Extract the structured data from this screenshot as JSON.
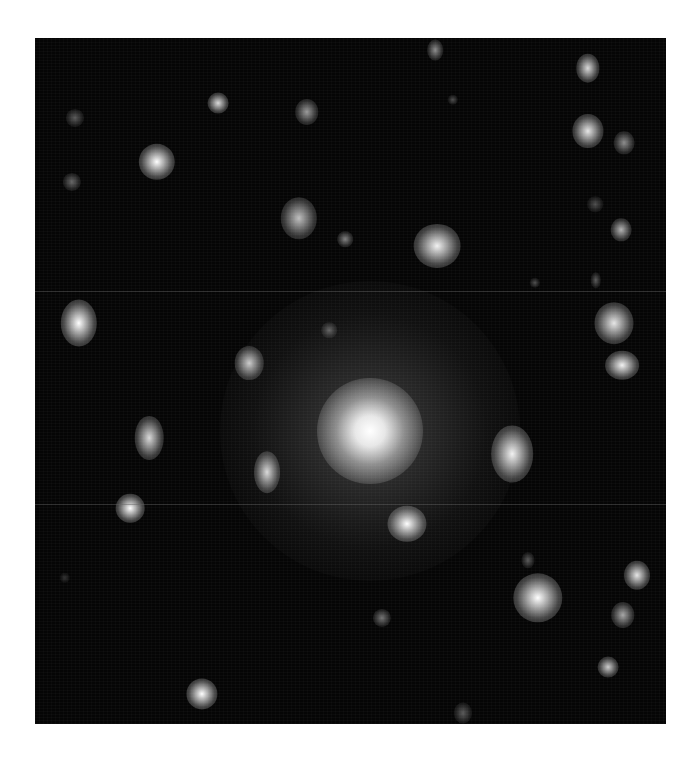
{
  "image": {
    "subject": "galaxy cluster (grayscale astronomical image)",
    "frame": {
      "left": 35,
      "top": 38,
      "width": 631,
      "height": 686
    },
    "background_color": "#050505",
    "central_galaxy": {
      "x": 335,
      "y": 393,
      "core_radius": 24,
      "halo_radius": 150
    },
    "galaxies": [
      {
        "x": 400,
        "y": 12,
        "rx": 6,
        "ry": 8,
        "b": 0.55
      },
      {
        "x": 553,
        "y": 30,
        "rx": 9,
        "ry": 11,
        "b": 0.85
      },
      {
        "x": 183,
        "y": 65,
        "rx": 8,
        "ry": 8,
        "b": 0.85
      },
      {
        "x": 272,
        "y": 74,
        "rx": 9,
        "ry": 10,
        "b": 0.6
      },
      {
        "x": 40,
        "y": 80,
        "rx": 7,
        "ry": 7,
        "b": 0.35
      },
      {
        "x": 418,
        "y": 62,
        "rx": 4,
        "ry": 4,
        "b": 0.3
      },
      {
        "x": 553,
        "y": 93,
        "rx": 12,
        "ry": 13,
        "b": 0.9
      },
      {
        "x": 589,
        "y": 105,
        "rx": 8,
        "ry": 9,
        "b": 0.55
      },
      {
        "x": 122,
        "y": 124,
        "rx": 14,
        "ry": 14,
        "b": 1.0
      },
      {
        "x": 37,
        "y": 144,
        "rx": 7,
        "ry": 7,
        "b": 0.4
      },
      {
        "x": 264,
        "y": 180,
        "rx": 14,
        "ry": 16,
        "b": 0.75
      },
      {
        "x": 310,
        "y": 201,
        "rx": 6,
        "ry": 6,
        "b": 0.5
      },
      {
        "x": 402,
        "y": 208,
        "rx": 18,
        "ry": 17,
        "b": 0.95
      },
      {
        "x": 560,
        "y": 166,
        "rx": 6,
        "ry": 6,
        "b": 0.3
      },
      {
        "x": 586,
        "y": 192,
        "rx": 8,
        "ry": 9,
        "b": 0.7
      },
      {
        "x": 500,
        "y": 245,
        "rx": 4,
        "ry": 4,
        "b": 0.3
      },
      {
        "x": 561,
        "y": 242,
        "rx": 4,
        "ry": 6,
        "b": 0.35
      },
      {
        "x": 44,
        "y": 285,
        "rx": 14,
        "ry": 18,
        "b": 1.0
      },
      {
        "x": 294,
        "y": 292,
        "rx": 6,
        "ry": 6,
        "b": 0.4
      },
      {
        "x": 579,
        "y": 285,
        "rx": 15,
        "ry": 16,
        "b": 0.9
      },
      {
        "x": 587,
        "y": 327,
        "rx": 13,
        "ry": 11,
        "b": 0.95
      },
      {
        "x": 214,
        "y": 325,
        "rx": 11,
        "ry": 13,
        "b": 0.8
      },
      {
        "x": 114,
        "y": 400,
        "rx": 11,
        "ry": 17,
        "b": 0.85
      },
      {
        "x": 477,
        "y": 416,
        "rx": 16,
        "ry": 22,
        "b": 0.95
      },
      {
        "x": 232,
        "y": 434,
        "rx": 10,
        "ry": 16,
        "b": 0.85
      },
      {
        "x": 95,
        "y": 470,
        "rx": 11,
        "ry": 11,
        "b": 1.0
      },
      {
        "x": 372,
        "y": 486,
        "rx": 15,
        "ry": 14,
        "b": 1.0
      },
      {
        "x": 493,
        "y": 522,
        "rx": 5,
        "ry": 6,
        "b": 0.35
      },
      {
        "x": 503,
        "y": 560,
        "rx": 19,
        "ry": 19,
        "b": 1.0
      },
      {
        "x": 602,
        "y": 537,
        "rx": 10,
        "ry": 11,
        "b": 0.9
      },
      {
        "x": 588,
        "y": 577,
        "rx": 9,
        "ry": 10,
        "b": 0.65
      },
      {
        "x": 347,
        "y": 580,
        "rx": 7,
        "ry": 7,
        "b": 0.45
      },
      {
        "x": 573,
        "y": 629,
        "rx": 8,
        "ry": 8,
        "b": 0.8
      },
      {
        "x": 167,
        "y": 656,
        "rx": 12,
        "ry": 12,
        "b": 1.0
      },
      {
        "x": 428,
        "y": 675,
        "rx": 7,
        "ry": 8,
        "b": 0.35
      },
      {
        "x": 30,
        "y": 540,
        "rx": 4,
        "ry": 4,
        "b": 0.2
      }
    ],
    "scanlines_y": [
      253,
      466
    ]
  }
}
